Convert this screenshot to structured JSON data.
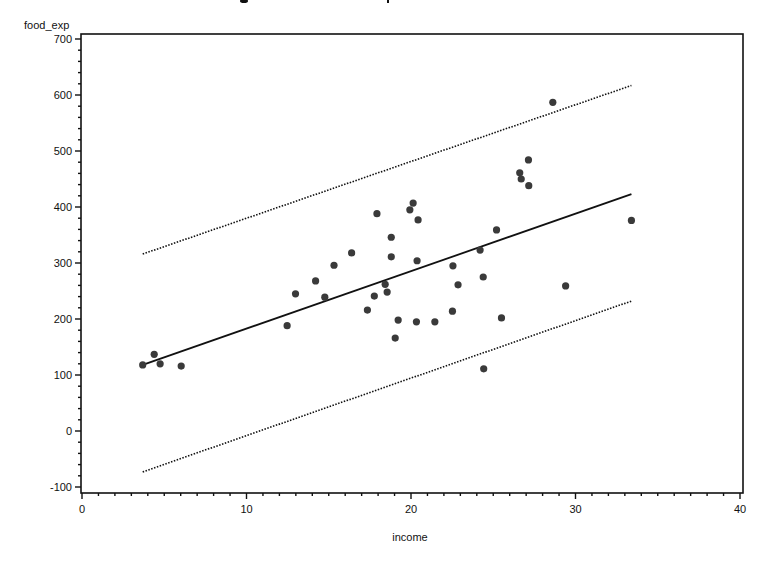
{
  "chart_data": {
    "type": "scatter",
    "title": "",
    "xlabel": "income",
    "ylabel": "food_exp",
    "xlim": [
      0,
      40
    ],
    "ylim": [
      -110,
      710
    ],
    "x_ticks": [
      0,
      10,
      20,
      30,
      40
    ],
    "y_ticks": [
      -100,
      0,
      100,
      200,
      300,
      400,
      500,
      600,
      700
    ],
    "x_minor_step": 1,
    "y_minor_step": 20,
    "grid": false,
    "legend": null,
    "series": [
      {
        "name": "observations",
        "kind": "scatter",
        "marker": "filled-circle",
        "color": "#3a3a3a",
        "points": [
          [
            3.69,
            118
          ],
          [
            4.39,
            137
          ],
          [
            4.75,
            120
          ],
          [
            6.03,
            116
          ],
          [
            12.47,
            188
          ],
          [
            12.98,
            245
          ],
          [
            14.2,
            268
          ],
          [
            14.76,
            239
          ],
          [
            15.32,
            296
          ],
          [
            16.39,
            318
          ],
          [
            17.35,
            216
          ],
          [
            17.77,
            241
          ],
          [
            17.93,
            388
          ],
          [
            18.43,
            262
          ],
          [
            18.55,
            248
          ],
          [
            18.8,
            346
          ],
          [
            18.8,
            311
          ],
          [
            19.04,
            166
          ],
          [
            19.22,
            198
          ],
          [
            19.93,
            395
          ],
          [
            20.13,
            407
          ],
          [
            20.33,
            195
          ],
          [
            20.37,
            304
          ],
          [
            20.43,
            377
          ],
          [
            21.45,
            195
          ],
          [
            22.52,
            214
          ],
          [
            22.55,
            295
          ],
          [
            22.86,
            261
          ],
          [
            24.2,
            323
          ],
          [
            24.39,
            275
          ],
          [
            24.42,
            111
          ],
          [
            25.2,
            359
          ],
          [
            25.5,
            202
          ],
          [
            26.61,
            461
          ],
          [
            26.7,
            450
          ],
          [
            27.14,
            484
          ],
          [
            27.16,
            438
          ],
          [
            28.62,
            587
          ],
          [
            29.4,
            259
          ],
          [
            33.4,
            376
          ]
        ]
      },
      {
        "name": "fitted regression line",
        "kind": "line",
        "style": "solid",
        "color": "#111111",
        "points": [
          [
            3.69,
            118
          ],
          [
            33.4,
            423
          ]
        ]
      },
      {
        "name": "upper prediction limit",
        "kind": "line",
        "style": "dotted",
        "color": "#111111",
        "points": [
          [
            3.69,
            316
          ],
          [
            33.4,
            617
          ]
        ]
      },
      {
        "name": "lower prediction limit",
        "kind": "line",
        "style": "dotted",
        "color": "#111111",
        "points": [
          [
            3.69,
            -73
          ],
          [
            33.4,
            232
          ]
        ]
      }
    ]
  },
  "axes": {
    "x_label": "income",
    "y_label": "food_exp",
    "x_tick_labels": [
      "0",
      "10",
      "20",
      "30",
      "40"
    ],
    "y_tick_labels": [
      "-100",
      "0",
      "100",
      "200",
      "300",
      "400",
      "500",
      "600",
      "700"
    ]
  },
  "colors": {
    "marker": "#3a3a3a",
    "line": "#111111",
    "axis": "#111111",
    "background": "#ffffff"
  }
}
